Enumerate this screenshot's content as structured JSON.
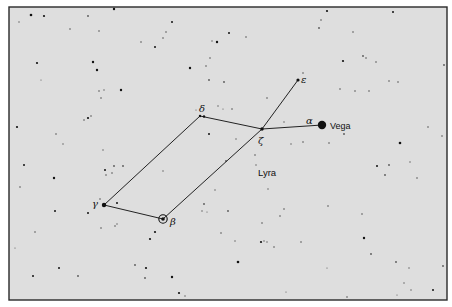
{
  "constellation": {
    "name": "Lyra",
    "name_position": [
      258,
      176
    ]
  },
  "colors": {
    "background": "#dedede",
    "ink": "#111111",
    "frame": "#2a2a2a"
  },
  "frame": {
    "x": 9,
    "y": 7,
    "width": 438,
    "height": 293
  },
  "labeled_stars": [
    {
      "id": "alpha",
      "greek": "α",
      "proper_name": "Vega",
      "x": 322,
      "y": 125,
      "r": 4.2,
      "greek_pos": [
        306,
        124
      ],
      "name_pos": [
        330,
        129
      ]
    },
    {
      "id": "beta",
      "greek": "β",
      "x": 163,
      "y": 219,
      "r": 1.8,
      "ringed": true,
      "greek_pos": [
        170,
        225
      ]
    },
    {
      "id": "gamma",
      "greek": "γ",
      "x": 104,
      "y": 205,
      "r": 2.2,
      "greek_pos": [
        92,
        207
      ]
    },
    {
      "id": "delta",
      "greek": "δ",
      "x": 200,
      "y": 116,
      "r": 1.2,
      "double": true,
      "greek_pos": [
        199,
        112
      ]
    },
    {
      "id": "epsilon",
      "greek": "ε",
      "x": 298,
      "y": 80,
      "r": 1.6,
      "greek_pos": [
        301,
        83
      ]
    },
    {
      "id": "zeta",
      "greek": "ζ",
      "x": 262,
      "y": 129,
      "r": 1.7,
      "greek_pos": [
        258,
        144
      ]
    }
  ],
  "lines": [
    [
      "zeta",
      "epsilon"
    ],
    [
      "zeta",
      "alpha"
    ],
    [
      "zeta",
      "delta"
    ],
    [
      "delta",
      "gamma"
    ],
    [
      "gamma",
      "beta"
    ],
    [
      "beta",
      "zeta"
    ]
  ],
  "background_stars": [
    [
      31,
      15,
      1.3
    ],
    [
      44,
      16,
      1.1
    ],
    [
      88,
      16,
      0.9
    ],
    [
      114,
      9,
      1.2
    ],
    [
      141,
      42,
      0.8
    ],
    [
      99,
      31,
      0.8
    ],
    [
      70,
      29,
      0.8
    ],
    [
      19,
      22,
      0.7
    ],
    [
      37,
      63,
      1.1
    ],
    [
      93,
      62,
      1.2
    ],
    [
      97,
      70,
      1.2
    ],
    [
      101,
      98,
      0.8
    ],
    [
      121,
      90,
      1.2
    ],
    [
      99,
      91,
      0.8
    ],
    [
      104,
      90,
      0.7
    ],
    [
      41,
      80,
      0.6
    ],
    [
      17,
      127,
      1.1
    ],
    [
      24,
      165,
      1.0
    ],
    [
      54,
      178,
      1.2
    ],
    [
      20,
      187,
      0.8
    ],
    [
      88,
      118,
      1.1
    ],
    [
      91,
      116,
      0.8
    ],
    [
      84,
      120,
      0.8
    ],
    [
      105,
      170,
      1.0
    ],
    [
      114,
      166,
      0.9
    ],
    [
      112,
      173,
      0.8
    ],
    [
      106,
      175,
      0.8
    ],
    [
      123,
      166,
      0.9
    ],
    [
      103,
      150,
      0.7
    ],
    [
      56,
      134,
      0.8
    ],
    [
      63,
      144,
      0.7
    ],
    [
      172,
      22,
      1.0
    ],
    [
      166,
      32,
      0.8
    ],
    [
      155,
      47,
      1.0
    ],
    [
      163,
      38,
      0.8
    ],
    [
      217,
      42,
      1.2
    ],
    [
      229,
      33,
      1.0
    ],
    [
      246,
      37,
      0.8
    ],
    [
      206,
      66,
      0.8
    ],
    [
      190,
      68,
      1.2
    ],
    [
      210,
      58,
      0.8
    ],
    [
      209,
      80,
      0.9
    ],
    [
      224,
      82,
      0.9
    ],
    [
      212,
      41,
      0.7
    ],
    [
      319,
      28,
      0.9
    ],
    [
      321,
      20,
      0.8
    ],
    [
      327,
      11,
      1.1
    ],
    [
      353,
      32,
      0.8
    ],
    [
      363,
      56,
      0.9
    ],
    [
      343,
      61,
      1.1
    ],
    [
      366,
      58,
      0.8
    ],
    [
      376,
      62,
      0.8
    ],
    [
      340,
      89,
      0.8
    ],
    [
      355,
      91,
      0.8
    ],
    [
      369,
      91,
      0.8
    ],
    [
      389,
      81,
      0.8
    ],
    [
      398,
      82,
      0.8
    ],
    [
      393,
      12,
      1.0
    ],
    [
      444,
      65,
      0.9
    ],
    [
      303,
      73,
      0.8
    ],
    [
      209,
      134,
      1.0
    ],
    [
      236,
      139,
      0.7
    ],
    [
      218,
      106,
      0.7
    ],
    [
      232,
      109,
      0.8
    ],
    [
      196,
      110,
      0.6
    ],
    [
      223,
      109,
      0.6
    ],
    [
      267,
      98,
      0.8
    ],
    [
      284,
      122,
      0.7
    ],
    [
      291,
      144,
      0.7
    ],
    [
      303,
      142,
      0.8
    ],
    [
      329,
      143,
      0.8
    ],
    [
      344,
      134,
      0.9
    ],
    [
      400,
      143,
      1.3
    ],
    [
      389,
      165,
      0.9
    ],
    [
      377,
      166,
      1.0
    ],
    [
      385,
      175,
      0.9
    ],
    [
      417,
      178,
      0.8
    ],
    [
      428,
      127,
      0.8
    ],
    [
      442,
      136,
      0.8
    ],
    [
      410,
      162,
      0.7
    ],
    [
      255,
      155,
      0.8
    ],
    [
      226,
      161,
      0.9
    ],
    [
      268,
      189,
      0.7
    ],
    [
      284,
      209,
      0.8
    ],
    [
      262,
      223,
      0.8
    ],
    [
      256,
      165,
      0.7
    ],
    [
      328,
      206,
      0.8
    ],
    [
      364,
      238,
      1.2
    ],
    [
      362,
      214,
      0.8
    ],
    [
      371,
      254,
      0.9
    ],
    [
      396,
      262,
      0.9
    ],
    [
      409,
      268,
      0.7
    ],
    [
      443,
      266,
      0.9
    ],
    [
      433,
      290,
      1.0
    ],
    [
      404,
      283,
      0.7
    ],
    [
      411,
      290,
      0.7
    ],
    [
      397,
      295,
      0.6
    ],
    [
      347,
      297,
      0.8
    ],
    [
      327,
      268,
      0.6
    ],
    [
      301,
      242,
      0.8
    ],
    [
      286,
      292,
      0.6
    ],
    [
      55,
      211,
      1.0
    ],
    [
      88,
      213,
      1.0
    ],
    [
      100,
      199,
      0.8
    ],
    [
      117,
      203,
      1.0
    ],
    [
      115,
      226,
      0.8
    ],
    [
      101,
      228,
      0.8
    ],
    [
      117,
      224,
      0.7
    ],
    [
      35,
      232,
      0.8
    ],
    [
      15,
      248,
      0.6
    ],
    [
      59,
      268,
      1.0
    ],
    [
      33,
      276,
      1.0
    ],
    [
      78,
      276,
      0.9
    ],
    [
      150,
      239,
      1.1
    ],
    [
      155,
      232,
      1.1
    ],
    [
      135,
      265,
      0.9
    ],
    [
      146,
      268,
      1.1
    ],
    [
      145,
      278,
      0.9
    ],
    [
      172,
      277,
      1.2
    ],
    [
      179,
      293,
      1.1
    ],
    [
      185,
      296,
      0.7
    ],
    [
      238,
      262,
      1.3
    ],
    [
      204,
      204,
      0.9
    ],
    [
      202,
      211,
      0.7
    ],
    [
      228,
      211,
      0.9
    ],
    [
      221,
      233,
      0.8
    ],
    [
      235,
      241,
      0.7
    ],
    [
      261,
      242,
      1.1
    ],
    [
      264,
      241,
      0.7
    ],
    [
      267,
      242,
      0.7
    ],
    [
      274,
      247,
      0.8
    ],
    [
      280,
      216,
      0.8
    ],
    [
      163,
      171,
      0.7
    ],
    [
      207,
      212,
      0.6
    ],
    [
      215,
      190,
      0.7
    ]
  ]
}
